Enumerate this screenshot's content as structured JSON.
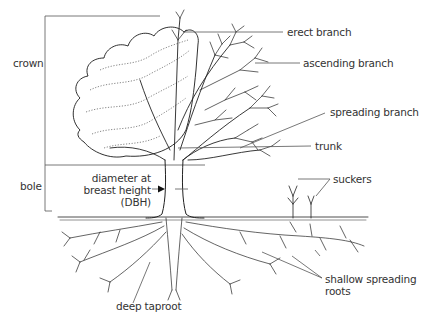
{
  "diagram": {
    "type": "labeled illustration",
    "colors": {
      "ink": "#222222",
      "leader": "#555555",
      "text": "#333333",
      "background": "#ffffff"
    },
    "brackets": {
      "crown": {
        "label": "crown"
      },
      "bole": {
        "label": "bole"
      }
    },
    "labels": {
      "erect_branch": "erect branch",
      "ascending_branch": "ascending branch",
      "spreading_branch": "spreading branch",
      "trunk": "trunk",
      "dbh_line1": "diameter at",
      "dbh_line2": "breast height",
      "dbh_line3": "(DBH)",
      "suckers": "suckers",
      "shallow_roots_line1": "shallow spreading",
      "shallow_roots_line2": "roots",
      "deep_taproot": "deep taproot"
    }
  }
}
